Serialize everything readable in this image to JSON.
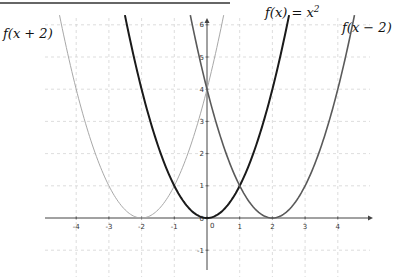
{
  "chart_data": {
    "type": "line",
    "title": "",
    "xlabel": "",
    "ylabel": "",
    "xlim": [
      -5,
      5
    ],
    "ylim": [
      -1.6,
      6.2
    ],
    "grid": true,
    "x_ticks": [
      "-4",
      "-3",
      "-2",
      "-1",
      "0",
      "1",
      "2",
      "3",
      "4"
    ],
    "y_ticks": [
      "-1",
      "0",
      "1",
      "2",
      "3",
      "4",
      "5",
      "6"
    ],
    "series": [
      {
        "name": "f(x + 2)",
        "expression": "(x+2)^2",
        "color": "#a8a8a8",
        "vertex": [
          -2,
          0
        ],
        "points": [
          [
            -4.5,
            6.25
          ],
          [
            -4,
            4
          ],
          [
            -3,
            1
          ],
          [
            -2,
            0
          ],
          [
            -1,
            1
          ],
          [
            0,
            4
          ],
          [
            0.45,
            6
          ]
        ]
      },
      {
        "name": "f(x) = x²",
        "expression": "x^2",
        "color": "#1a1a1a",
        "vertex": [
          0,
          0
        ],
        "points": [
          [
            -2.45,
            6
          ],
          [
            -2,
            4
          ],
          [
            -1,
            1
          ],
          [
            0,
            0
          ],
          [
            1,
            1
          ],
          [
            2,
            4
          ],
          [
            2.45,
            6
          ]
        ]
      },
      {
        "name": "f(x − 2)",
        "expression": "(x-2)^2",
        "color": "#5a5a5a",
        "vertex": [
          2,
          0
        ],
        "points": [
          [
            -0.45,
            6
          ],
          [
            0,
            4
          ],
          [
            1,
            1
          ],
          [
            2,
            0
          ],
          [
            3,
            1
          ],
          [
            4,
            4
          ],
          [
            4.45,
            6
          ]
        ]
      }
    ],
    "annotations": [
      "f(x + 2)",
      "f(x) = x²",
      "f(x − 2)"
    ],
    "legend_position": "labels at curve tops"
  },
  "labels": {
    "left": "f(x + 2)",
    "center": "f(x) = x",
    "center_sup": "2",
    "right": "f(x − 2)"
  }
}
